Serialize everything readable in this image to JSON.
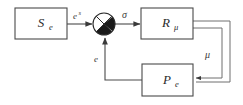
{
  "diagram": {
    "type": "block-diagram",
    "background_color": "#ffffff",
    "line_color": "#4a4a4a",
    "blocks": [
      {
        "id": "source",
        "name": "S_e",
        "base": "S",
        "subscript": "e"
      },
      {
        "id": "regulator",
        "name": "R_mu",
        "base": "R",
        "subscript": "μ"
      },
      {
        "id": "plant",
        "name": "P_e",
        "base": "P",
        "subscript": "e"
      }
    ],
    "junction": {
      "id": "summing-junction",
      "name": "summing-junction",
      "style": "crossed-circle-filled-quadrants"
    },
    "signals": [
      {
        "id": "input-signal",
        "base": "e",
        "superscript": "s",
        "from": "source",
        "to": "summing-junction"
      },
      {
        "id": "sigma-signal",
        "base": "σ",
        "superscript": "",
        "from": "summing-junction",
        "to": "regulator"
      },
      {
        "id": "mu-signal",
        "base": "μ",
        "superscript": "",
        "from": "regulator",
        "to": "plant"
      },
      {
        "id": "error-signal",
        "base": "e",
        "superscript": "",
        "from": "plant",
        "to": "summing-junction"
      }
    ]
  }
}
